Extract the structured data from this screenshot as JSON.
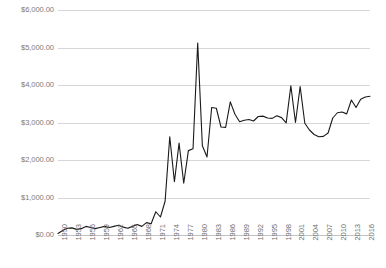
{
  "chart_data": {
    "type": "line",
    "title": "",
    "xlabel": "",
    "ylabel": "",
    "ylim": [
      0,
      6000
    ],
    "ytick_values": [
      0,
      1000,
      2000,
      3000,
      4000,
      5000,
      6000
    ],
    "ytick_labels": [
      "$0.00",
      "$1,000.00",
      "$2,000.00",
      "$3,000.00",
      "$4,000.00",
      "$5,000.00",
      "$6,000.00"
    ],
    "xlim": [
      1950,
      2017
    ],
    "xtick_labels": [
      "1950",
      "1953",
      "1956",
      "1959",
      "1962",
      "1965",
      "1968",
      "1971",
      "1974",
      "1977",
      "1980",
      "1983",
      "1986",
      "1989",
      "1992",
      "1995",
      "1998",
      "2001",
      "2004",
      "2007",
      "2010",
      "2013",
      "2016"
    ],
    "xtick_values": [
      1950,
      1953,
      1956,
      1959,
      1962,
      1965,
      1968,
      1971,
      1974,
      1977,
      1980,
      1983,
      1986,
      1989,
      1992,
      1995,
      1998,
      2001,
      2004,
      2007,
      2010,
      2013,
      2016
    ],
    "xtick_rotation": -90,
    "grid": "horizontal",
    "legend": "none",
    "line_color": "#1a1a1a",
    "gridline_color": "#d6d6d6",
    "label_color": "#7a7a7a",
    "x": [
      1950,
      1951,
      1952,
      1953,
      1954,
      1955,
      1956,
      1957,
      1958,
      1959,
      1960,
      1961,
      1962,
      1963,
      1964,
      1965,
      1966,
      1967,
      1968,
      1969,
      1970,
      1971,
      1972,
      1973,
      1974,
      1975,
      1976,
      1977,
      1978,
      1979,
      1980,
      1981,
      1982,
      1983,
      1984,
      1985,
      1986,
      1987,
      1988,
      1989,
      1990,
      1991,
      1992,
      1993,
      1994,
      1995,
      1996,
      1997,
      1998,
      1999,
      2000,
      2001,
      2002,
      2003,
      2004,
      2005,
      2006,
      2007,
      2008,
      2009,
      2010,
      2011,
      2012,
      2013,
      2014,
      2015,
      2016,
      2017
    ],
    "y": [
      40,
      120,
      180,
      190,
      150,
      170,
      230,
      200,
      170,
      200,
      230,
      200,
      230,
      260,
      210,
      180,
      230,
      280,
      230,
      330,
      300,
      620,
      480,
      900,
      2620,
      1420,
      2450,
      1380,
      2250,
      2300,
      5120,
      2380,
      2080,
      3400,
      3380,
      2880,
      2870,
      3550,
      3220,
      3020,
      3060,
      3080,
      3040,
      3160,
      3170,
      3120,
      3110,
      3180,
      3130,
      2990,
      3980,
      3000,
      3960,
      2980,
      2800,
      2680,
      2620,
      2630,
      2720,
      3120,
      3260,
      3280,
      3230,
      3600,
      3400,
      3620,
      3680,
      3700
    ]
  }
}
